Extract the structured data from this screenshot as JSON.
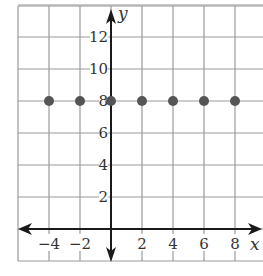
{
  "chart_data": {
    "type": "scatter",
    "title": "",
    "xlabel": "x",
    "ylabel": "y",
    "xlim": [
      -5,
      9
    ],
    "ylim": [
      -2,
      14
    ],
    "grid": true,
    "grid_step": 2,
    "x_tick_labels": [
      "−4",
      "−2",
      "2",
      "4",
      "6",
      "8"
    ],
    "x_ticks": [
      -4,
      -2,
      2,
      4,
      6,
      8
    ],
    "y_tick_labels": [
      "2",
      "4",
      "6",
      "8",
      "10",
      "12"
    ],
    "y_ticks": [
      2,
      4,
      6,
      8,
      10,
      12
    ],
    "series": [
      {
        "name": "points",
        "x": [
          -4,
          -2,
          0,
          2,
          4,
          6,
          8
        ],
        "y": [
          8,
          8,
          8,
          8,
          8,
          8,
          8
        ]
      }
    ],
    "colors": {
      "grid": "#9a9a9a",
      "axis": "#1a1a1a",
      "point": "#555555",
      "text": "#333333"
    }
  }
}
